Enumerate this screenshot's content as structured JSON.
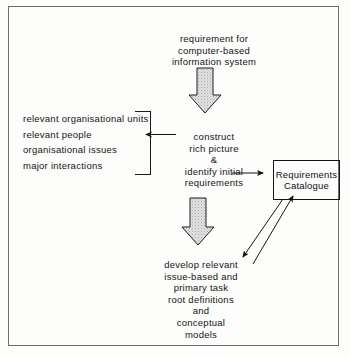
{
  "diagram": {
    "title_note": "soft systems / requirements engineering process diagram",
    "top_input": "requirement for\ncomputer-based\ninformation system",
    "left_list": {
      "items": [
        "relevant organisational units",
        "relevant people",
        "organisational issues",
        "major interactions"
      ],
      "text": "relevant organisational units\nrelevant people\norganisational issues\nmajor interactions"
    },
    "stage_one": "construct\nrich picture\n&\nidentify initial\nrequirements",
    "stage_two": "develop relevant\nissue-based and\nprimary task\nroot definitions\nand\nconceptual\nmodels",
    "catalogue": "Requirements\nCatalogue",
    "arrows": [
      {
        "name": "top-block-arrow",
        "direction": "down",
        "style": "block-stippled"
      },
      {
        "name": "mid-block-arrow",
        "direction": "down",
        "style": "block-stippled"
      },
      {
        "name": "list-arrow",
        "direction": "left",
        "style": "thin-line"
      },
      {
        "name": "catalogue-input-arrow",
        "direction": "right",
        "style": "thin-line"
      },
      {
        "name": "catalogue-feedback-arrow",
        "direction": "down-left",
        "style": "thin-line"
      },
      {
        "name": "catalogue-output-arrow",
        "direction": "up-right",
        "style": "thin-line"
      }
    ],
    "colors": {
      "ink": "#141414",
      "frame": "#6e6e6e",
      "arrow_fill": "#d9d9d9",
      "page": "#fdfdfc"
    }
  }
}
